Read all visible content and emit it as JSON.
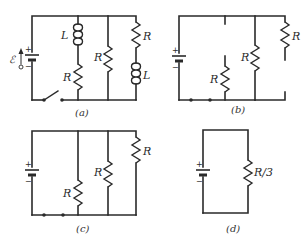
{
  "figure": {
    "panels": [
      {
        "id": "a",
        "caption": "(a)",
        "battery": {
          "plus": "+",
          "minus": "−",
          "emf_symbol": "ℰ"
        },
        "switch": "open",
        "branches": [
          {
            "components": [
              "L",
              "R"
            ]
          },
          {
            "components": [
              "R"
            ]
          },
          {
            "components": [
              "R",
              "L"
            ]
          }
        ]
      },
      {
        "id": "b",
        "caption": "(b)",
        "battery": {
          "plus": "+",
          "minus": "−"
        },
        "switch": "removed (closed contacts)",
        "branches": [
          {
            "components": [
              "open",
              "R"
            ]
          },
          {
            "components": [
              "R"
            ]
          },
          {
            "components": [
              "R",
              "open"
            ]
          }
        ]
      },
      {
        "id": "c",
        "caption": "(c)",
        "battery": {
          "plus": "+",
          "minus": "−"
        },
        "branches": [
          {
            "components": [
              "R"
            ]
          },
          {
            "components": [
              "R"
            ]
          },
          {
            "components": [
              "R"
            ]
          }
        ]
      },
      {
        "id": "d",
        "caption": "(d)",
        "battery": {
          "plus": "+",
          "minus": "−"
        },
        "branches": [
          {
            "components": [
              "R/3"
            ]
          }
        ]
      }
    ],
    "labels": {
      "R": "R",
      "L": "L",
      "R3": "R/3",
      "emf": "ℰ",
      "plus": "+",
      "minus": "−",
      "cap_a": "(a)",
      "cap_b": "(b)",
      "cap_c": "(c)",
      "cap_d": "(d)"
    }
  }
}
